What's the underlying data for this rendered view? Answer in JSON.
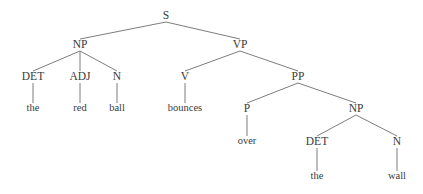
{
  "figure": {
    "type": "constituency-parse-tree",
    "sentence": "the red ball bounces over the wall",
    "background_color": "#ffffff",
    "line_color": "#6e6e6e",
    "text_color": "#3a3a3a",
    "width": 423,
    "height": 194
  },
  "nodes": [
    {
      "id": "S",
      "label": "S",
      "kind": "phrase",
      "x": 166,
      "y": 16
    },
    {
      "id": "NP1",
      "label": "NP",
      "kind": "phrase",
      "x": 80,
      "y": 45
    },
    {
      "id": "VP",
      "label": "VP",
      "kind": "phrase",
      "x": 240,
      "y": 45
    },
    {
      "id": "DET1",
      "label": "DET",
      "kind": "pos",
      "x": 33,
      "y": 77
    },
    {
      "id": "ADJ1",
      "label": "ADJ",
      "kind": "pos",
      "x": 80,
      "y": 77
    },
    {
      "id": "N1",
      "label": "N",
      "kind": "pos",
      "x": 117,
      "y": 77
    },
    {
      "id": "V1",
      "label": "V",
      "kind": "pos",
      "x": 185,
      "y": 77
    },
    {
      "id": "PP",
      "label": "PP",
      "kind": "phrase",
      "x": 298,
      "y": 77
    },
    {
      "id": "W_the1",
      "label": "the",
      "kind": "word",
      "x": 33,
      "y": 109
    },
    {
      "id": "W_red",
      "label": "red",
      "kind": "word",
      "x": 80,
      "y": 109
    },
    {
      "id": "W_ball",
      "label": "ball",
      "kind": "word",
      "x": 117,
      "y": 109
    },
    {
      "id": "W_boun",
      "label": "bounces",
      "kind": "word",
      "x": 185,
      "y": 109
    },
    {
      "id": "P1",
      "label": "P",
      "kind": "pos",
      "x": 247,
      "y": 109
    },
    {
      "id": "NP2",
      "label": "NP",
      "kind": "phrase",
      "x": 356,
      "y": 109
    },
    {
      "id": "W_over",
      "label": "over",
      "kind": "word",
      "x": 247,
      "y": 142
    },
    {
      "id": "DET2",
      "label": "DET",
      "kind": "pos",
      "x": 317,
      "y": 142
    },
    {
      "id": "N2",
      "label": "N",
      "kind": "pos",
      "x": 397,
      "y": 142
    },
    {
      "id": "W_the2",
      "label": "the",
      "kind": "word",
      "x": 317,
      "y": 177
    },
    {
      "id": "W_wall",
      "label": "wall",
      "kind": "word",
      "x": 397,
      "y": 177
    }
  ],
  "edges": [
    {
      "from": "S",
      "to": "NP1"
    },
    {
      "from": "S",
      "to": "VP"
    },
    {
      "from": "NP1",
      "to": "DET1"
    },
    {
      "from": "NP1",
      "to": "ADJ1"
    },
    {
      "from": "NP1",
      "to": "N1"
    },
    {
      "from": "VP",
      "to": "V1"
    },
    {
      "from": "VP",
      "to": "PP"
    },
    {
      "from": "DET1",
      "to": "W_the1"
    },
    {
      "from": "ADJ1",
      "to": "W_red"
    },
    {
      "from": "N1",
      "to": "W_ball"
    },
    {
      "from": "V1",
      "to": "W_boun"
    },
    {
      "from": "PP",
      "to": "P1"
    },
    {
      "from": "PP",
      "to": "NP2"
    },
    {
      "from": "P1",
      "to": "W_over"
    },
    {
      "from": "NP2",
      "to": "DET2"
    },
    {
      "from": "NP2",
      "to": "N2"
    },
    {
      "from": "DET2",
      "to": "W_the2"
    },
    {
      "from": "N2",
      "to": "W_wall"
    }
  ]
}
